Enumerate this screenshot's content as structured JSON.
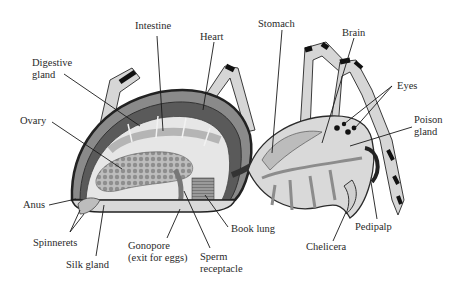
{
  "diagram": {
    "labels": {
      "intestine": "Intestine",
      "heart": "Heart",
      "stomach": "Stomach",
      "brain": "Brain",
      "digestive_gland_1": "Digestive",
      "digestive_gland_2": "gland",
      "eyes": "Eyes",
      "poison_gland_1": "Poison",
      "poison_gland_2": "gland",
      "ovary": "Ovary",
      "anus": "Anus",
      "spinnerets": "Spinnerets",
      "silk_gland": "Silk gland",
      "gonopore_1": "Gonopore",
      "gonopore_2": "(exit for eggs)",
      "sperm_receptacle_1": "Sperm",
      "sperm_receptacle_2": "receptacle",
      "book_lung": "Book  lung",
      "chelicera": "Chelicera",
      "pedipalp": "Pedipalp"
    },
    "colors": {
      "background": "#ffffff",
      "outline": "#2b2b2b",
      "body_fill": "#d9d9d9",
      "light_fill": "#ececec",
      "dark_fill": "#5a5a5a",
      "leader_line": "#1a1a1a",
      "text": "#2a2a2a"
    }
  }
}
